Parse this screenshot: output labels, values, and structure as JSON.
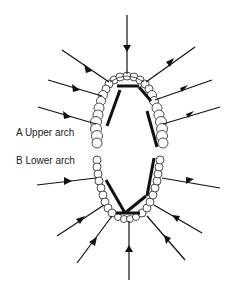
{
  "diagram": {
    "type": "dental arch force diagram",
    "labels": {
      "upper": "A Upper arch",
      "lower": "B Lower arch"
    },
    "colors": {
      "line": "#111111",
      "tooth_outline": "#222222",
      "background": "#ffffff"
    },
    "upper_arch": {
      "arrow_count": 7,
      "bar_count": 3
    },
    "lower_arch": {
      "arrow_count": 7,
      "bar_count": 3
    }
  }
}
